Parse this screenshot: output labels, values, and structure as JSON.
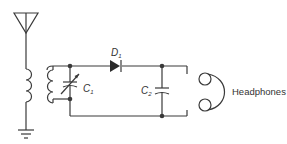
{
  "diagram": {
    "type": "circuit-schematic",
    "components": [
      {
        "id": "antenna",
        "label": ""
      },
      {
        "id": "transformer",
        "label": ""
      },
      {
        "id": "C1",
        "label": "C",
        "sub": "1",
        "kind": "variable-capacitor"
      },
      {
        "id": "D1",
        "label": "D",
        "sub": "1",
        "kind": "diode"
      },
      {
        "id": "C2",
        "label": "C",
        "sub": "2",
        "kind": "capacitor"
      },
      {
        "id": "headphones",
        "label": "Headphones",
        "kind": "headphones"
      },
      {
        "id": "ground",
        "label": "",
        "kind": "ground"
      }
    ],
    "colors": {
      "line": "#3a3a3a",
      "text": "#333333",
      "background": "#ffffff"
    }
  }
}
